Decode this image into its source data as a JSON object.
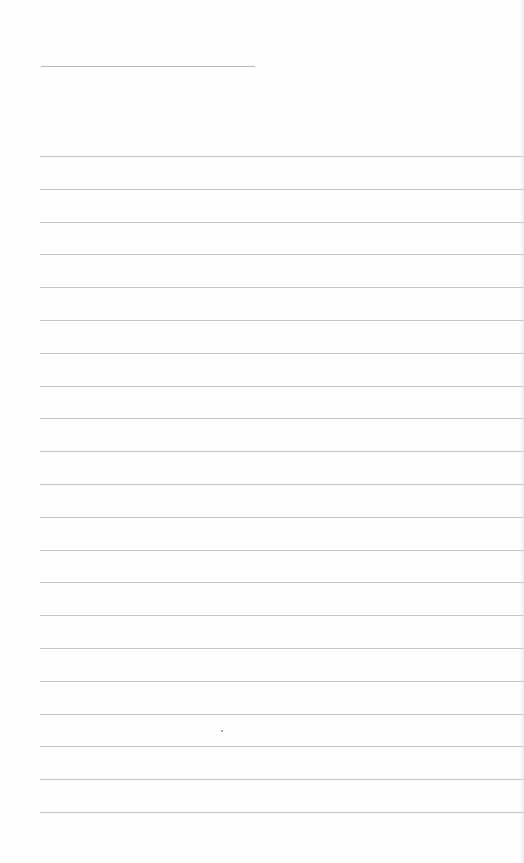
{
  "page": {
    "type": "lined-notebook-page",
    "title_line": {
      "visible": true
    },
    "rules": {
      "count": 21,
      "first_y": 156,
      "spacing": 32.8,
      "color": "#c4c4c4"
    },
    "background_color": "#fefefe",
    "text_content": ""
  }
}
